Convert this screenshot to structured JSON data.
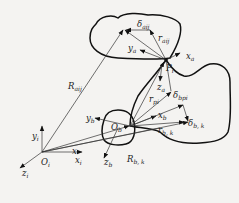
{
  "diagram": {
    "type": "kinematic-coordinate-frames",
    "background": "#f4f3f1",
    "stroke_color": "#111111",
    "frames": {
      "inertial": {
        "origin": "O",
        "origin_sub": "i",
        "x": "x",
        "x_sub": "i",
        "y": "y",
        "y_sub": "i",
        "z": "z",
        "z_sub": "i"
      },
      "body": {
        "origin": "O",
        "origin_sub": "b",
        "x": "x",
        "x_sub": "b",
        "y": "y",
        "y_sub": "b",
        "z": "z",
        "z_sub": "b"
      },
      "contact": {
        "point": "P",
        "point_sub": "i",
        "x": "x",
        "x_sub": "a",
        "y": "y",
        "y_sub": "a",
        "z": "z",
        "z_sub": "a"
      }
    },
    "vectors": [
      {
        "name": "R",
        "sub": "aij"
      },
      {
        "name": "r",
        "sub": "aij"
      },
      {
        "name": "δ",
        "sub": "aij"
      },
      {
        "name": "x",
        "sub": ""
      },
      {
        "name": "R",
        "sub": "b, k"
      },
      {
        "name": "r",
        "sub": "b, k"
      },
      {
        "name": "δ",
        "sub": "b, k"
      },
      {
        "name": "r",
        "sub": "pi"
      },
      {
        "name": "δ",
        "sub": "bpi"
      }
    ]
  }
}
